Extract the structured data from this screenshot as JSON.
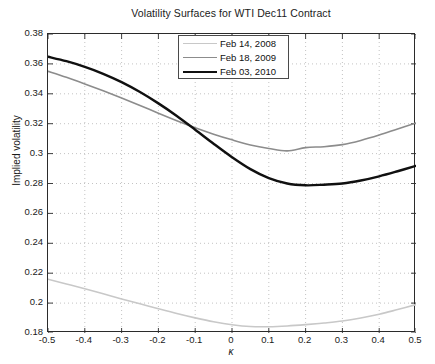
{
  "chart_data": {
    "type": "line",
    "title": "Volatility Surfaces for WTI Dec11 Contract",
    "xlabel": "κ",
    "ylabel": "Implied volatility",
    "xlim": [
      -0.5,
      0.5
    ],
    "ylim": [
      0.18,
      0.38
    ],
    "xticks": [
      "-0.5",
      "-0.4",
      "-0.3",
      "-0.2",
      "-0.1",
      "0",
      "0.1",
      "0.2",
      "0.3",
      "0.4",
      "0.5"
    ],
    "xtick_values": [
      -0.5,
      -0.4,
      -0.3,
      -0.2,
      -0.1,
      0,
      0.1,
      0.2,
      0.3,
      0.4,
      0.5
    ],
    "yticks": [
      "0.18",
      "0.2",
      "0.22",
      "0.24",
      "0.26",
      "0.28",
      "0.3",
      "0.32",
      "0.34",
      "0.36",
      "0.38"
    ],
    "ytick_values": [
      0.18,
      0.2,
      0.22,
      0.24,
      0.26,
      0.28,
      0.3,
      0.32,
      0.34,
      0.36,
      0.38
    ],
    "grid": true,
    "grid_style": "dotted",
    "legend_position": "top-center",
    "x": [
      -0.5,
      -0.45,
      -0.4,
      -0.35,
      -0.3,
      -0.25,
      -0.2,
      -0.15,
      -0.1,
      -0.05,
      0,
      0.05,
      0.1,
      0.15,
      0.2,
      0.25,
      0.3,
      0.35,
      0.4,
      0.45,
      0.5
    ],
    "series": [
      {
        "name": "Feb 14, 2008",
        "color": "#c8c8c8",
        "width": 1.6,
        "values": [
          0.216,
          0.2128,
          0.2096,
          0.2062,
          0.2028,
          0.1995,
          0.1962,
          0.193,
          0.1901,
          0.1875,
          0.1855,
          0.1843,
          0.1842,
          0.1847,
          0.1856,
          0.1867,
          0.188,
          0.19,
          0.1925,
          0.1957,
          0.199
        ]
      },
      {
        "name": "Feb 18, 2009",
        "color": "#8c8c8c",
        "width": 1.6,
        "values": [
          0.355,
          0.351,
          0.3466,
          0.342,
          0.3372,
          0.3322,
          0.327,
          0.322,
          0.3173,
          0.313,
          0.3092,
          0.3058,
          0.3034,
          0.3018,
          0.304,
          0.3046,
          0.306,
          0.3088,
          0.3124,
          0.3165,
          0.3205
        ]
      },
      {
        "name": "Feb 03, 2010",
        "color": "#101010",
        "width": 2.4,
        "values": [
          0.3648,
          0.3618,
          0.358,
          0.3534,
          0.3478,
          0.3412,
          0.3336,
          0.3252,
          0.316,
          0.3066,
          0.2976,
          0.2896,
          0.2836,
          0.28,
          0.2788,
          0.2792,
          0.28,
          0.282,
          0.2848,
          0.2882,
          0.2918
        ]
      }
    ]
  },
  "legend": {
    "items": [
      {
        "label": "Feb 14, 2008"
      },
      {
        "label": "Feb 18, 2009"
      },
      {
        "label": "Feb 03, 2010"
      }
    ]
  }
}
